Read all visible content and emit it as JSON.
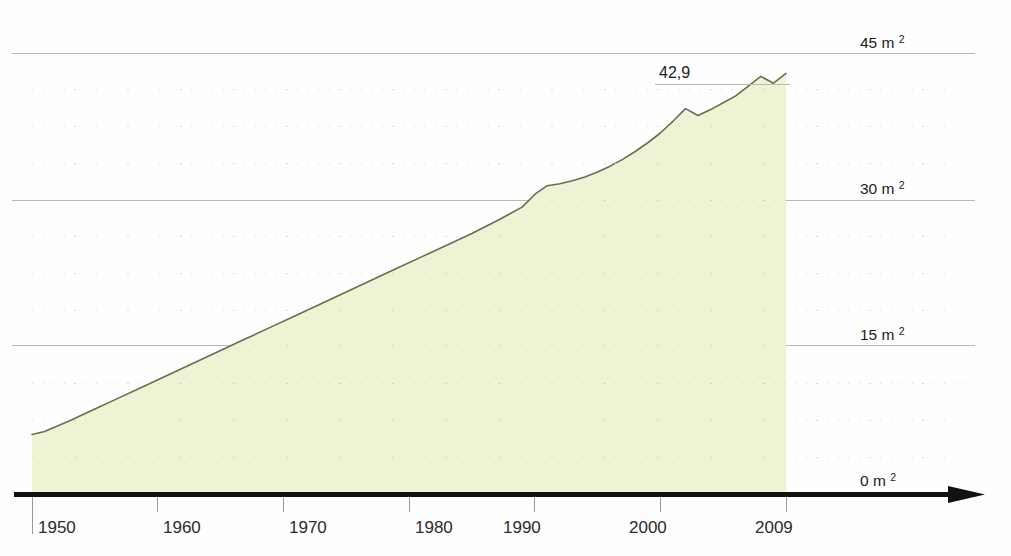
{
  "chart_data": {
    "type": "area",
    "title": "",
    "subtitle": "",
    "xlabel": "",
    "ylabel": "",
    "unit": "m²",
    "xlim": [
      1949,
      2009
    ],
    "ylim": [
      0,
      45
    ],
    "grid": true,
    "grid_major_step": 15,
    "grid_minor_step": 3.75,
    "legend_position": "none",
    "x_tick_labels": [
      "1950",
      "1960",
      "1970",
      "1980",
      "1990",
      "2000",
      "2009"
    ],
    "x_tick_values": [
      1950,
      1960,
      1970,
      1980,
      1990,
      2000,
      2009
    ],
    "y_tick_labels": [
      "0 m²",
      "15 m²",
      "30 m²",
      "45 m²"
    ],
    "y_tick_values": [
      0,
      15,
      30,
      45
    ],
    "annotations": [
      {
        "label": "42,9",
        "x": 2009,
        "y": 42.9
      }
    ],
    "series": [
      {
        "name": "Wohnfläche je Person",
        "fill_color": "#edf4d3",
        "line_color": "#6b6b57",
        "x": [
          1949,
          1950,
          1952,
          1954,
          1956,
          1958,
          1960,
          1962,
          1964,
          1966,
          1968,
          1970,
          1972,
          1974,
          1976,
          1978,
          1980,
          1982,
          1984,
          1986,
          1987,
          1988,
          1989,
          1990,
          1991,
          1992,
          1993,
          1994,
          1995,
          1996,
          1997,
          1998,
          1999,
          2000,
          2001,
          2002,
          2003,
          2004,
          2005,
          2006,
          2007,
          2008,
          2009
        ],
        "values": [
          5.9,
          6.2,
          7.3,
          8.5,
          9.7,
          10.9,
          12.1,
          13.3,
          14.5,
          15.7,
          16.9,
          18.1,
          19.3,
          20.5,
          21.7,
          22.9,
          24.1,
          25.3,
          26.5,
          27.8,
          28.5,
          29.2,
          30.5,
          31.4,
          31.6,
          31.9,
          32.3,
          32.8,
          33.4,
          34.1,
          34.9,
          35.8,
          36.8,
          38.0,
          39.3,
          38.6,
          39.2,
          39.9,
          40.6,
          41.6,
          42.6,
          41.9,
          42.9
        ]
      }
    ]
  },
  "axis": {
    "arrow": "right-arrow",
    "baseline_year": 1950,
    "end_year": 2009
  }
}
